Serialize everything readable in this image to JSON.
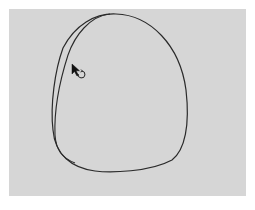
{
  "canvas": {
    "background": "#d6d6d6",
    "stroke_color": "#2a2a2a",
    "stroke_width": 1.2,
    "shapes": [
      {
        "type": "freehand-loop",
        "outer_path": "M 63 48 C 75 25, 95 13, 116 14 C 150 15, 180 45, 186 90 C 190 125, 185 150, 172 160 C 150 172, 110 173, 95 171 C 72 168, 55 155, 53 130 C 50 105, 55 70, 63 48 Z",
        "inner_path": "M 110 14 C 90 16, 75 35, 68 55 C 60 80, 54 110, 55 135 C 56 150, 62 158, 75 163"
      }
    ]
  },
  "cursor": {
    "icon": "arrow-pointer-with-rotate-icon",
    "x": 72,
    "y": 64
  }
}
